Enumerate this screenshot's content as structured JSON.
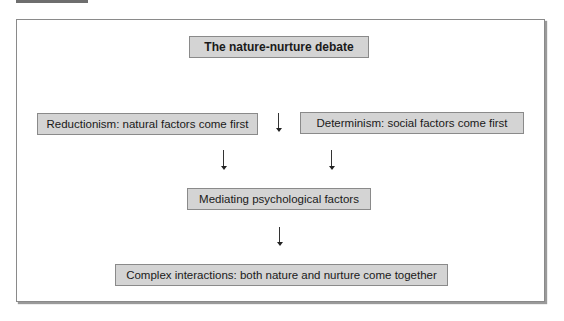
{
  "diagram": {
    "title": "The nature-nurture debate",
    "left_box": "Reductionism: natural factors come first",
    "right_box": "Determinism: social factors come first",
    "middle_box": "Mediating psychological factors",
    "bottom_box": "Complex interactions: both nature and nurture come together",
    "arrows": [
      "center-top",
      "left-to-middle",
      "right-to-middle",
      "middle-to-bottom"
    ],
    "colors": {
      "box_fill": "#d4d4d4",
      "border": "#8a8a8a",
      "text": "#1a1a1a"
    }
  }
}
